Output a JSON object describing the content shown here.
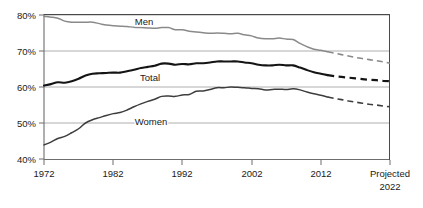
{
  "chart_data": {
    "type": "line",
    "title": "",
    "subtitle": "",
    "xlabel": "",
    "ylabel": "",
    "xlim": [
      1972,
      2022
    ],
    "ylim": [
      40,
      80
    ],
    "grid": true,
    "legend_position": "inline-labels",
    "y_tick_labels": [
      "80%",
      "70%",
      "60%",
      "50%",
      "40%"
    ],
    "y_tick_values": [
      80,
      70,
      60,
      50,
      40
    ],
    "x_tick_labels": [
      "1972",
      "1982",
      "1992",
      "2002",
      "2012",
      "Projected"
    ],
    "x_tick_sublabels": [
      "",
      "",
      "",
      "",
      "",
      "2022"
    ],
    "x_tick_values": [
      1972,
      1982,
      1992,
      2002,
      2012,
      2022
    ],
    "projection_start_year": 2013,
    "series": [
      {
        "name": "Men",
        "label": "Men",
        "color": "#8a8a8a",
        "style": "solid",
        "x": [
          1972,
          1973,
          1974,
          1975,
          1976,
          1977,
          1978,
          1979,
          1980,
          1981,
          1982,
          1983,
          1984,
          1985,
          1986,
          1987,
          1988,
          1989,
          1990,
          1991,
          1992,
          1993,
          1994,
          1995,
          1996,
          1997,
          1998,
          1999,
          2000,
          2001,
          2002,
          2003,
          2004,
          2005,
          2006,
          2007,
          2008,
          2009,
          2010,
          2011,
          2012,
          2013
        ],
        "values": [
          79.6,
          79.4,
          79.1,
          78.3,
          78.0,
          78.0,
          78.0,
          78.0,
          77.6,
          77.2,
          77.0,
          76.9,
          76.8,
          76.6,
          76.5,
          76.4,
          76.3,
          76.5,
          76.5,
          75.9,
          75.9,
          75.5,
          75.3,
          75.1,
          74.9,
          75.0,
          74.9,
          74.8,
          74.9,
          74.5,
          74.2,
          73.6,
          73.4,
          73.4,
          73.6,
          73.3,
          73.2,
          72.1,
          71.2,
          70.5,
          70.2,
          69.8
        ]
      },
      {
        "name": "Men projected",
        "label": "Men projected",
        "color": "#8a8a8a",
        "style": "dashed",
        "x": [
          2013,
          2014,
          2015,
          2016,
          2017,
          2018,
          2019,
          2020,
          2021,
          2022
        ],
        "values": [
          69.8,
          69.4,
          69.0,
          68.6,
          68.2,
          67.9,
          67.6,
          67.3,
          67.0,
          66.6
        ]
      },
      {
        "name": "Total",
        "label": "Total",
        "color": "#141414",
        "style": "solid",
        "x": [
          1972,
          1973,
          1974,
          1975,
          1976,
          1977,
          1978,
          1979,
          1980,
          1981,
          1982,
          1983,
          1984,
          1985,
          1986,
          1987,
          1988,
          1989,
          1990,
          1991,
          1992,
          1993,
          1994,
          1995,
          1996,
          1997,
          1998,
          1999,
          2000,
          2001,
          2002,
          2003,
          2004,
          2005,
          2006,
          2007,
          2008,
          2009,
          2010,
          2011,
          2012,
          2013
        ],
        "values": [
          60.4,
          60.8,
          61.3,
          61.2,
          61.6,
          62.3,
          63.2,
          63.7,
          63.8,
          63.9,
          64.0,
          64.0,
          64.4,
          64.8,
          65.3,
          65.6,
          65.9,
          66.5,
          66.5,
          66.2,
          66.4,
          66.3,
          66.6,
          66.6,
          66.8,
          67.1,
          67.1,
          67.1,
          67.1,
          66.8,
          66.6,
          66.2,
          66.0,
          66.0,
          66.2,
          66.0,
          66.0,
          65.4,
          64.7,
          64.1,
          63.7,
          63.3
        ]
      },
      {
        "name": "Total projected",
        "label": "Total projected",
        "color": "#141414",
        "style": "dashed",
        "x": [
          2013,
          2014,
          2015,
          2016,
          2017,
          2018,
          2019,
          2020,
          2021,
          2022
        ],
        "values": [
          63.3,
          63.0,
          62.8,
          62.6,
          62.4,
          62.2,
          62.0,
          61.9,
          61.7,
          61.6
        ]
      },
      {
        "name": "Women",
        "label": "Women",
        "color": "#3d3d3d",
        "style": "solid",
        "x": [
          1972,
          1973,
          1974,
          1975,
          1976,
          1977,
          1978,
          1979,
          1980,
          1981,
          1982,
          1983,
          1984,
          1985,
          1986,
          1987,
          1988,
          1989,
          1990,
          1991,
          1992,
          1993,
          1994,
          1995,
          1996,
          1997,
          1998,
          1999,
          2000,
          2001,
          2002,
          2003,
          2004,
          2005,
          2006,
          2007,
          2008,
          2009,
          2010,
          2011,
          2012,
          2013
        ],
        "values": [
          43.9,
          44.7,
          45.7,
          46.3,
          47.3,
          48.4,
          50.0,
          50.9,
          51.5,
          52.1,
          52.6,
          52.9,
          53.6,
          54.5,
          55.3,
          56.0,
          56.6,
          57.4,
          57.5,
          57.4,
          57.8,
          57.9,
          58.8,
          58.9,
          59.3,
          59.8,
          59.8,
          60.0,
          59.9,
          59.8,
          59.6,
          59.5,
          59.2,
          59.3,
          59.4,
          59.3,
          59.5,
          59.2,
          58.6,
          58.1,
          57.7,
          57.2
        ]
      },
      {
        "name": "Women projected",
        "label": "Women projected",
        "color": "#3d3d3d",
        "style": "dashed",
        "x": [
          2013,
          2014,
          2015,
          2016,
          2017,
          2018,
          2019,
          2020,
          2021,
          2022
        ],
        "values": [
          57.2,
          56.8,
          56.5,
          56.1,
          55.8,
          55.5,
          55.2,
          55.0,
          54.7,
          54.5
        ]
      }
    ],
    "annotations": [
      {
        "name": "men-label",
        "text": "Men",
        "x": 1991,
        "y": 78.2
      },
      {
        "name": "total-label",
        "text": "Total",
        "x": 1992,
        "y": 62.6
      },
      {
        "name": "women-label",
        "text": "Women",
        "x": 1993,
        "y": 50.7
      }
    ]
  },
  "axis": {
    "y": {
      "t80": "80%",
      "t70": "70%",
      "t60": "60%",
      "t50": "50%",
      "t40": "40%"
    },
    "x": {
      "t1972": "1972",
      "t1982": "1982",
      "t1992": "1992",
      "t2002": "2002",
      "t2012": "2012",
      "t2022_top": "Projected",
      "t2022_bottom": "2022"
    }
  },
  "labels": {
    "men": "Men",
    "total": "Total",
    "women": "Women"
  },
  "colors": {
    "men": "#8a8a8a",
    "total": "#141414",
    "women": "#3d3d3d",
    "grid": "#9a9a9a",
    "axis": "#6d6d6d",
    "background": "#ffffff"
  }
}
